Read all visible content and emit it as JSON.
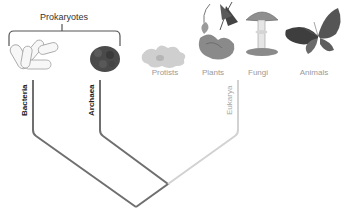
{
  "diagram": {
    "group_label": "Prokaryotes",
    "kingdoms": [
      {
        "name": "Protists",
        "x": 165
      },
      {
        "name": "Plants",
        "x": 213
      },
      {
        "name": "Fungi",
        "x": 258
      },
      {
        "name": "Animals",
        "x": 314
      }
    ],
    "domains": [
      {
        "name": "Bacteria",
        "style": "dark"
      },
      {
        "name": "Archaea",
        "style": "dark"
      },
      {
        "name": "Eukarya",
        "style": "light"
      }
    ],
    "colors": {
      "prokaryote_branch": "#6f6f6f",
      "eukarya_branch": "#d2d2d2",
      "bracket": "#555555",
      "kingdom_label": "#9a9a9a"
    }
  }
}
